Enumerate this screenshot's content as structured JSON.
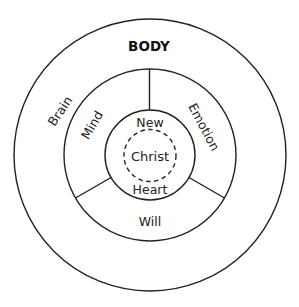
{
  "diagram": {
    "title": "BODY",
    "center": {
      "x": 150,
      "y": 155
    },
    "colors": {
      "stroke": "#222222",
      "text": "#222222",
      "background": "#ffffff"
    },
    "rings": [
      {
        "name": "body",
        "radius": 136,
        "style": "solid"
      },
      {
        "name": "soul",
        "radius": 86,
        "style": "solid"
      },
      {
        "name": "heart",
        "radius": 45,
        "style": "solid"
      },
      {
        "name": "christ",
        "radius": 26,
        "style": "dashed"
      }
    ],
    "dividers_angles_deg": [
      0,
      120,
      240
    ],
    "labels": {
      "body": "BODY",
      "brain": "Brain",
      "mind": "Mind",
      "emotion": "Emotion",
      "will": "Will",
      "new": "New",
      "heart": "Heart",
      "christ": "Christ"
    }
  }
}
